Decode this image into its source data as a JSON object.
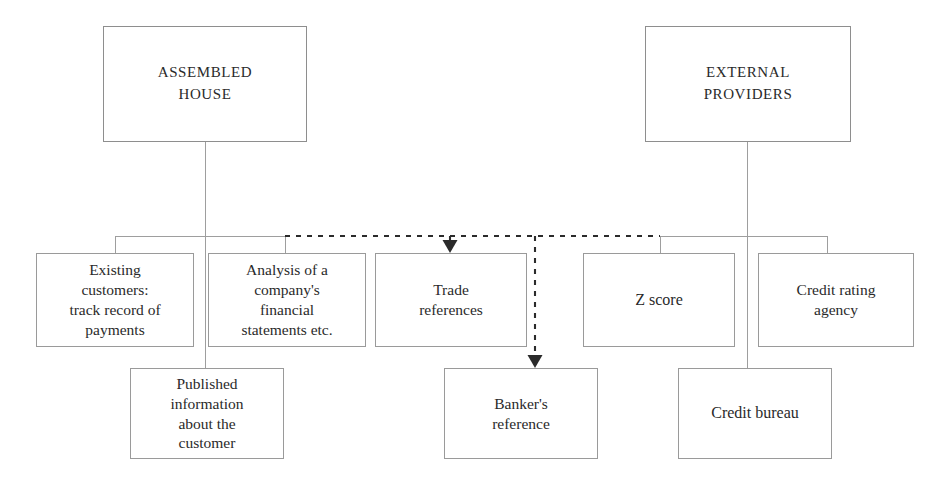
{
  "diagram": {
    "style": {
      "box_border_color": "#9a9a9a",
      "connector_color": "#9e9e9e",
      "dashed_connector_color": "#2b2b2b",
      "text_color": "#2a2a2a",
      "background": "#ffffff"
    },
    "nodes": [
      {
        "id": "assembled-house",
        "name": "assembled-house",
        "label": "ASSEMBLED\nHOUSE",
        "tier": "top",
        "x": 103,
        "y": 26,
        "w": 204,
        "h": 116
      },
      {
        "id": "external-providers",
        "name": "external-providers",
        "label": "EXTERNAL\nPROVIDERS",
        "tier": "top",
        "x": 645,
        "y": 26,
        "w": 206,
        "h": 116
      },
      {
        "id": "existing-customers",
        "name": "existing-customers-track-record",
        "label": "Existing\ncustomers:\ntrack record of\npayments",
        "tier": "mid",
        "x": 36,
        "y": 253,
        "w": 158,
        "h": 94
      },
      {
        "id": "analysis-financial-statements",
        "name": "analysis-of-financial-statements",
        "label": "Analysis of a\ncompany's\nfinancial\nstatements etc.",
        "tier": "mid",
        "x": 208,
        "y": 253,
        "w": 158,
        "h": 94
      },
      {
        "id": "trade-references",
        "name": "trade-references",
        "label": "Trade\nreferences",
        "tier": "mid",
        "x": 375,
        "y": 253,
        "w": 152,
        "h": 94
      },
      {
        "id": "z-score",
        "name": "z-score",
        "label": "Z score",
        "tier": "mid",
        "x": 583,
        "y": 253,
        "w": 152,
        "h": 94
      },
      {
        "id": "credit-rating-agency",
        "name": "credit-rating-agency",
        "label": "Credit rating\nagency",
        "tier": "mid",
        "x": 758,
        "y": 253,
        "w": 156,
        "h": 94
      },
      {
        "id": "published-information",
        "name": "published-information-about-customer",
        "label": "Published\ninformation\nabout the\ncustomer",
        "tier": "bottom",
        "x": 130,
        "y": 368,
        "w": 154,
        "h": 91
      },
      {
        "id": "bankers-reference",
        "name": "bankers-reference",
        "label": "Banker's\nreference",
        "tier": "bottom",
        "x": 444,
        "y": 368,
        "w": 154,
        "h": 91
      },
      {
        "id": "credit-bureau",
        "name": "credit-bureau",
        "label": "Credit bureau",
        "tier": "bottom",
        "x": 678,
        "y": 368,
        "w": 154,
        "h": 91
      }
    ],
    "connectors": {
      "solid": [
        {
          "name": "trunk-assembled-house",
          "d": "M 205 142 L 205 368"
        },
        {
          "name": "bar-assembled-house-children",
          "d": "M 115 236 L 285 236"
        },
        {
          "name": "drop-existing-customers",
          "d": "M 115 236 L 115 253"
        },
        {
          "name": "drop-analysis-financial",
          "d": "M 285 236 L 285 253"
        },
        {
          "name": "trunk-external-providers",
          "d": "M 747 142 L 747 368"
        },
        {
          "name": "bar-external-providers-children",
          "d": "M 660 236 L 827 236"
        },
        {
          "name": "drop-z-score",
          "d": "M 660 236 L 660 253"
        },
        {
          "name": "drop-credit-rating-agency",
          "d": "M 827 236 L 827 253"
        }
      ],
      "dashed": [
        {
          "name": "dashed-bar-bank-links",
          "d": "M 285 236 L 660 236"
        },
        {
          "name": "dashed-drop-trade-references",
          "d": "M 450 236 L 450 244"
        },
        {
          "name": "dashed-drop-bankers-reference",
          "d": "M 535 236 L 535 359"
        }
      ],
      "arrowheads": [
        {
          "name": "arrowhead-into-trade-references",
          "x": 450,
          "y": 253
        },
        {
          "name": "arrowhead-into-bankers-reference",
          "x": 535,
          "y": 368
        }
      ]
    }
  }
}
